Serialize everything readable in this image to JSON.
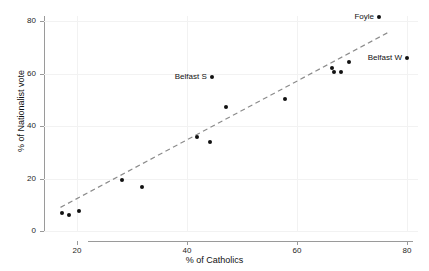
{
  "chart_data": {
    "type": "scatter",
    "title": "",
    "subtitle": "",
    "xlabel": "% of Catholics",
    "ylabel": "% of Nationalist vote",
    "xlim": [
      14,
      82
    ],
    "ylim": [
      0,
      82
    ],
    "xticks": [
      20,
      40,
      60,
      80
    ],
    "xticklabels": [
      "20",
      "40",
      "60",
      "80"
    ],
    "yticks": [
      0,
      20,
      40,
      60,
      80
    ],
    "yticklabels": [
      "0",
      "20",
      "40",
      "60",
      "80"
    ],
    "grid": true,
    "legend": "none",
    "marker": "filled-circle",
    "marker_color": "#111111",
    "points": [
      {
        "x": 17.3,
        "y": 7.0,
        "label": ""
      },
      {
        "x": 18.6,
        "y": 6.0,
        "label": ""
      },
      {
        "x": 20.4,
        "y": 7.8,
        "label": ""
      },
      {
        "x": 28.1,
        "y": 19.5,
        "label": ""
      },
      {
        "x": 31.9,
        "y": 16.8,
        "label": ""
      },
      {
        "x": 41.9,
        "y": 35.8,
        "label": ""
      },
      {
        "x": 44.2,
        "y": 34.0,
        "label": ""
      },
      {
        "x": 44.5,
        "y": 58.7,
        "label": "Belfast S"
      },
      {
        "x": 47.1,
        "y": 47.3,
        "label": ""
      },
      {
        "x": 57.8,
        "y": 50.4,
        "label": ""
      },
      {
        "x": 66.4,
        "y": 62.1,
        "label": ""
      },
      {
        "x": 66.8,
        "y": 60.6,
        "label": ""
      },
      {
        "x": 68.0,
        "y": 60.6,
        "label": ""
      },
      {
        "x": 69.5,
        "y": 64.6,
        "label": ""
      },
      {
        "x": 74.9,
        "y": 81.8,
        "label": "Foyle"
      },
      {
        "x": 80.0,
        "y": 65.8,
        "label": "Belfast W"
      }
    ],
    "trend_line": {
      "style": "dashed",
      "color": "#8c8c8c",
      "x_start": 17.0,
      "y_start": 9.0,
      "x_end": 76.8,
      "y_end": 76.0
    }
  },
  "axes": {
    "x_title": "% of Catholics",
    "y_title": "% of Nationalist vote"
  },
  "colors": {
    "marker": "#111111",
    "trend": "#8c8c8c",
    "axis": "#9a9a9a",
    "grid": "#f2f2f2",
    "background": "#ffffff",
    "text": "#262626"
  }
}
